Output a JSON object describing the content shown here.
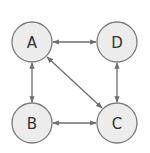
{
  "diagram": {
    "type": "graph",
    "directed": "bidirectional",
    "nodes": [
      {
        "id": "A",
        "label": "A",
        "cx": 32,
        "cy": 42
      },
      {
        "id": "D",
        "label": "D",
        "cx": 117,
        "cy": 42
      },
      {
        "id": "B",
        "label": "B",
        "cx": 32,
        "cy": 123
      },
      {
        "id": "C",
        "label": "C",
        "cx": 117,
        "cy": 123
      }
    ],
    "edges": [
      {
        "from": "A",
        "to": "D",
        "arrows": "both"
      },
      {
        "from": "A",
        "to": "B",
        "arrows": "both"
      },
      {
        "from": "A",
        "to": "C",
        "arrows": "both"
      },
      {
        "from": "D",
        "to": "C",
        "arrows": "both"
      },
      {
        "from": "B",
        "to": "C",
        "arrows": "both"
      }
    ],
    "colors": {
      "node_fill": "#ececec",
      "node_stroke": "#7a7a7a",
      "edge": "#6e6e6e",
      "label": "#333333"
    }
  }
}
